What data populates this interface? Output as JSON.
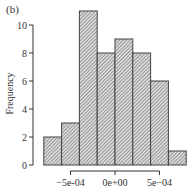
{
  "panel_label": "(b)",
  "chart_data": {
    "type": "bar",
    "subtype": "histogram",
    "title": "",
    "panel_label": "(b)",
    "xlabel": "",
    "ylabel": "Frequency",
    "bin_edges": [
      -0.0008,
      -0.0006,
      -0.0004,
      -0.0002,
      0.0,
      0.0002,
      0.0004,
      0.0006,
      0.0008
    ],
    "categories": [
      "[-8e-04,-6e-04)",
      "[-6e-04,-4e-04)",
      "[-4e-04,-2e-04)",
      "[-2e-04,0e+00)",
      "[0e+00,2e-04)",
      "[2e-04,4e-04)",
      "[4e-04,6e-04)",
      "[6e-04,8e-04)"
    ],
    "values": [
      2,
      3,
      11,
      8,
      9,
      8,
      6,
      1
    ],
    "ylim": [
      0,
      11
    ],
    "yticks": [
      0,
      2,
      4,
      6,
      8,
      10
    ],
    "ytick_labels": [
      "0",
      "2",
      "4",
      "6",
      "8",
      "10"
    ],
    "xticks": [
      -0.0005,
      0.0,
      0.0005
    ],
    "xtick_labels": [
      "-5e-04",
      "0e+00",
      "5e-04"
    ],
    "grid": false,
    "legend": null,
    "fill": "diagonal-hatch",
    "bar_color": "#bdbdbd",
    "edge_color": "#444444"
  }
}
